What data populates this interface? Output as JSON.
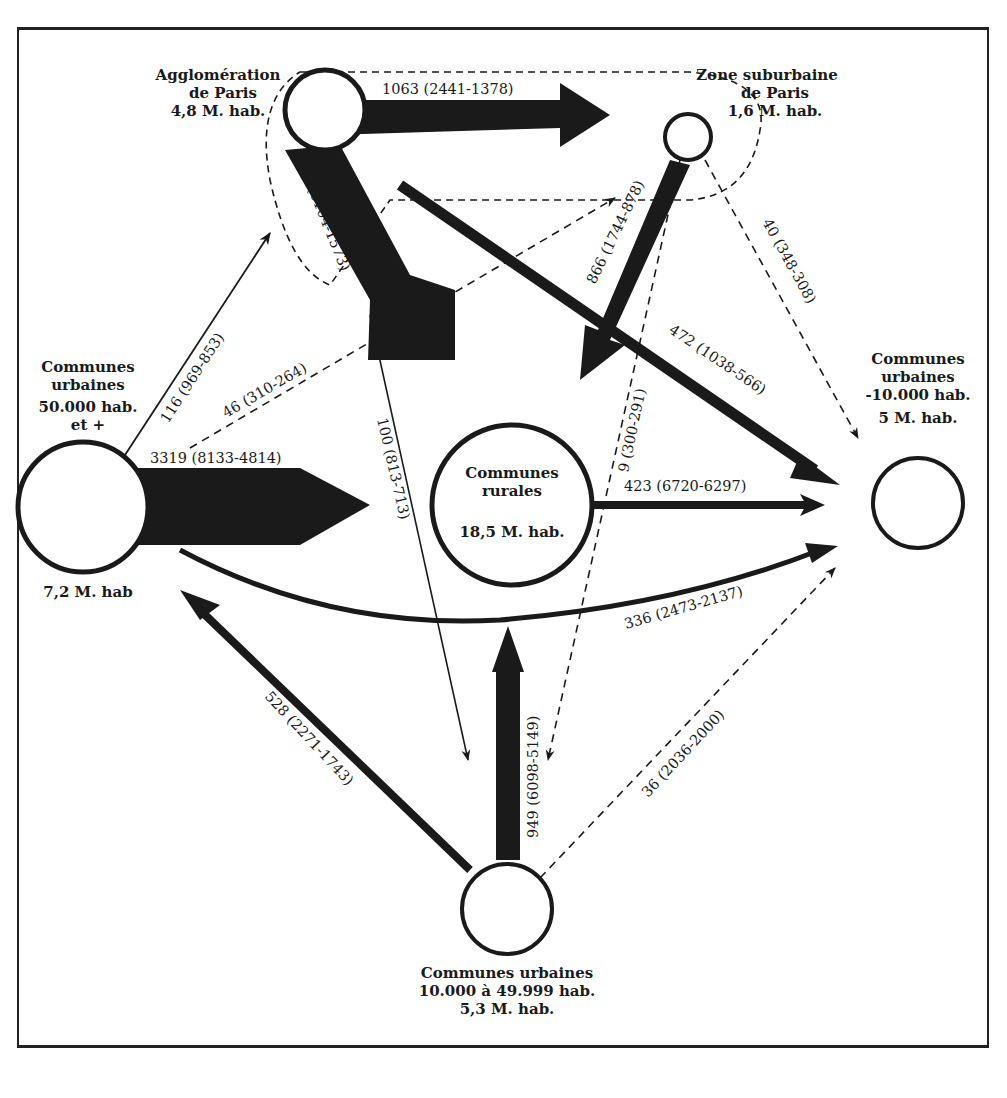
{
  "nodes": {
    "paris": {
      "line1": "Agglomération",
      "line2": "de Paris",
      "line3": "4,8 M. hab."
    },
    "suburb": {
      "line1": "Zone suburbaine",
      "line2": "de Paris",
      "line3": "1,6 M. hab."
    },
    "large_urban": {
      "line1": "Communes",
      "line2": "urbaines",
      "line3": "50.000 hab.",
      "line4": "et +",
      "pop": "7,2 M. hab"
    },
    "rural": {
      "line1": "Communes",
      "line2": "rurales",
      "pop": "18,5 M. hab."
    },
    "small_urban": {
      "line1": "Communes",
      "line2": "urbaines",
      "line3": "-10.000 hab.",
      "pop": "5 M. hab."
    },
    "medium_urban": {
      "line1": "Communes urbaines",
      "line2": "10.000 à 49.999 hab.",
      "pop": "5,3 M. hab."
    }
  },
  "flows": {
    "paris_to_suburb": "1063 (2441-1378)",
    "paris_to_rural": "4531 (6104-1573)",
    "suburb_to_rural": "866 (1744-878)",
    "paris_to_small": "472 (1038-566)",
    "suburb_to_small": "40 (348-308)",
    "large_to_paris": "116 (969-853)",
    "large_to_suburb": "46 (310-264)",
    "large_to_rural": "3319 (8133-4814)",
    "paris_to_medium": "100 (813-713)",
    "suburb_to_medium": "9 (300-291)",
    "rural_to_small": "423 (6720-6297)",
    "large_to_small": "336 (2473-2137)",
    "medium_to_large": "528 (2271-1743)",
    "medium_to_rural": "949 (6098-5149)",
    "medium_to_small": "36 (2036-2000)"
  },
  "colors": {
    "ink": "#1a1a1a",
    "paper": "#ffffff"
  }
}
